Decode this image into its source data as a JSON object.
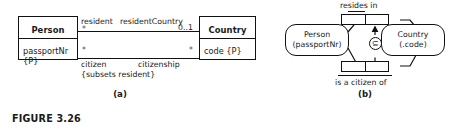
{
  "figure": {
    "caption": "FIGURE 3.26",
    "part_a_label": "(a)",
    "part_b_label": "(b)"
  },
  "panel_a": {
    "type": "uml-class-diagram",
    "classes": [
      {
        "name": "Person",
        "attributes": [
          "passportNr {P}"
        ]
      },
      {
        "name": "Country",
        "attributes": [
          "code {P}"
        ]
      }
    ],
    "associations": [
      {
        "source_role": "resident",
        "source_multiplicity": "*",
        "target_role": "residentCountry",
        "target_multiplicity": "0..1"
      },
      {
        "source_role": "citizen",
        "source_multiplicity": "*",
        "target_role": "citizenship",
        "target_multiplicity": "*",
        "constraint": "{subsets resident}"
      }
    ]
  },
  "panel_b": {
    "type": "orm-diagram",
    "entities": [
      {
        "name": "Person",
        "reference_mode": "(passportNr)"
      },
      {
        "name": "Country",
        "reference_mode": "(.code)"
      }
    ],
    "predicates": [
      {
        "label": "resides in",
        "label_position": "above"
      },
      {
        "label": "is a citizen of",
        "label_position": "below"
      }
    ],
    "constraint": {
      "kind": "subset",
      "symbol": "⊆"
    }
  }
}
